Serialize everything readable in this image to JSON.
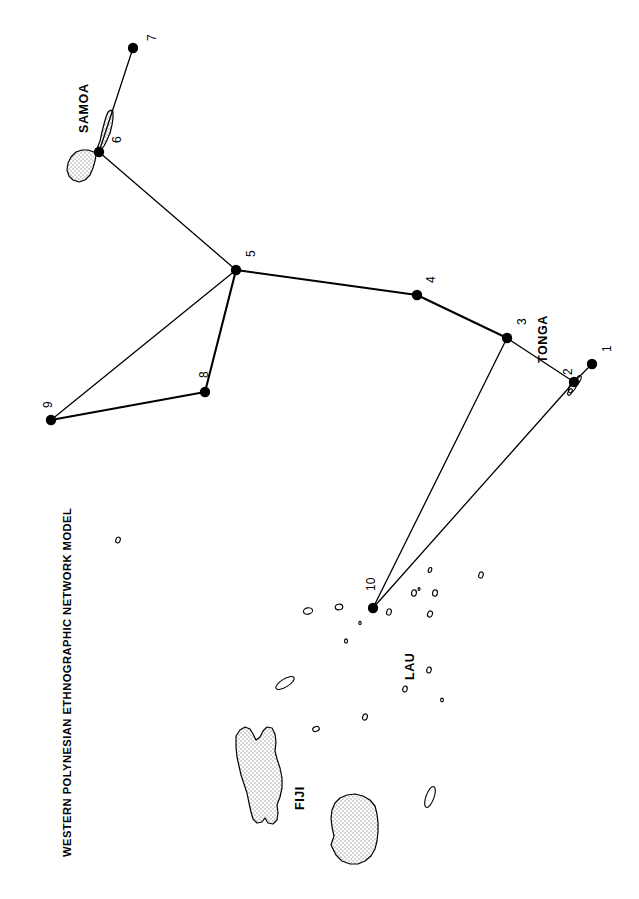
{
  "figure": {
    "title": "WESTERN POLYNESIAN ETHNOGRAPHIC NETWORK MODEL",
    "title_orientation": "rotated-90-ccw",
    "background_color": "#ffffff",
    "ink_color": "#000000",
    "island_fill": "#e6e6e6",
    "width": 639,
    "height": 899
  },
  "region_labels": [
    {
      "name": "samoa-label",
      "text": "SAMOA",
      "x": 78,
      "y": 133,
      "rotate": -90
    },
    {
      "name": "tonga-label",
      "text": "TONGA",
      "x": 537,
      "y": 363,
      "rotate": -90
    },
    {
      "name": "lau-label",
      "text": "LAU",
      "x": 404,
      "y": 680,
      "rotate": -90
    },
    {
      "name": "fiji-label",
      "text": "FIJI",
      "x": 294,
      "y": 810,
      "rotate": -90
    }
  ],
  "network": {
    "node_count": 10,
    "edge_count": 10,
    "node_radius": 5.2,
    "nodes": [
      {
        "id": "1",
        "label": "1",
        "x": 592,
        "y": 364,
        "label_x": 601,
        "label_y": 352,
        "region": "Tonga"
      },
      {
        "id": "2",
        "label": "2",
        "x": 574,
        "y": 382,
        "label_x": 562,
        "label_y": 375,
        "region": "Tonga"
      },
      {
        "id": "3",
        "label": "3",
        "x": 507,
        "y": 338,
        "label_x": 516,
        "label_y": 325,
        "region": "Tonga"
      },
      {
        "id": "4",
        "label": "4",
        "x": 417,
        "y": 295,
        "label_x": 425,
        "label_y": 283,
        "region": "open-sea"
      },
      {
        "id": "5",
        "label": "5",
        "x": 236,
        "y": 270,
        "label_x": 245,
        "label_y": 257,
        "region": "open-sea"
      },
      {
        "id": "6",
        "label": "6",
        "x": 99,
        "y": 152,
        "label_x": 111,
        "label_y": 143,
        "region": "Samoa"
      },
      {
        "id": "7",
        "label": "7",
        "x": 133,
        "y": 48,
        "label_x": 146,
        "label_y": 41,
        "region": "Samoa"
      },
      {
        "id": "8",
        "label": "8",
        "x": 205,
        "y": 392,
        "label_x": 198,
        "label_y": 378,
        "region": "open-sea"
      },
      {
        "id": "9",
        "label": "9",
        "x": 51,
        "y": 420,
        "label_x": 42,
        "label_y": 408,
        "region": "open-sea"
      },
      {
        "id": "10",
        "label": "10",
        "x": 373,
        "y": 608,
        "label_x": 365,
        "label_y": 591,
        "region": "Lau"
      }
    ],
    "edges": [
      {
        "from": "7",
        "to": "6",
        "weight": "thin"
      },
      {
        "from": "6",
        "to": "5",
        "weight": "thin"
      },
      {
        "from": "5",
        "to": "4",
        "weight": "thick"
      },
      {
        "from": "4",
        "to": "3",
        "weight": "thick"
      },
      {
        "from": "3",
        "to": "2",
        "weight": "thin"
      },
      {
        "from": "2",
        "to": "1",
        "weight": "thin"
      },
      {
        "from": "5",
        "to": "8",
        "weight": "thick"
      },
      {
        "from": "5",
        "to": "9",
        "weight": "thin"
      },
      {
        "from": "8",
        "to": "9",
        "weight": "thick"
      },
      {
        "from": "3",
        "to": "10",
        "weight": "thin"
      },
      {
        "from": "2",
        "to": "10",
        "weight": "thin"
      }
    ]
  },
  "islands": {
    "large": [
      {
        "name": "savaii-island",
        "group": "Samoa",
        "path": "M 97,149 L 100,141 L 102,132 L 104,124 L 106,117 L 108,112 L 111,110 L 113,112 L 113,118 L 112,125 L 110,133 L 107,140 L 104,146 L 101,150 Z"
      },
      {
        "name": "upolu-island",
        "group": "Samoa",
        "path": "M 94,152 L 88,150 L 82,150 L 76,152 L 71,157 L 68,163 L 67,170 L 69,176 L 73,180 L 79,182 L 85,180 L 90,175 L 93,168 L 95,161 L 96,155 Z"
      },
      {
        "name": "vanua-levu-island",
        "group": "Fiji",
        "path": "M 236,736 L 240,730 L 245,727 L 250,729 L 253,734 L 256,740 L 260,737 L 263,731 L 267,727 L 272,728 L 275,734 L 276,742 L 275,751 L 277,759 L 280,768 L 282,778 L 282,788 L 280,797 L 277,805 L 278,813 L 277,820 L 273,824 L 268,823 L 265,818 L 262,822 L 257,823 L 253,819 L 251,812 L 249,803 L 247,793 L 244,784 L 241,775 L 239,766 L 237,757 L 236,747 Z"
      },
      {
        "name": "viti-levu-island",
        "group": "Fiji",
        "path": "M 331,845 L 334,836 L 332,827 L 331,818 L 332,810 L 335,803 L 340,798 L 347,795 L 355,794 L 363,796 L 370,800 L 375,806 L 377,814 L 378,823 L 378,832 L 377,841 L 375,849 L 371,856 L 365,861 L 358,864 L 350,864 L 342,861 L 336,855 Z"
      }
    ],
    "small": [
      {
        "name": "tonga-islet-a",
        "cx": 573,
        "cy": 386,
        "rx": 3.2,
        "ry": 7.5,
        "rot": 28
      },
      {
        "name": "tonga-islet-b",
        "cx": 578,
        "cy": 380,
        "rx": 2.2,
        "ry": 5.0,
        "rot": 30
      },
      {
        "name": "tonga-islet-c",
        "cx": 570,
        "cy": 392,
        "rx": 1.8,
        "ry": 3.6,
        "rot": 25
      },
      {
        "name": "lau-islet-01",
        "cx": 430,
        "cy": 570,
        "rx": 1.6,
        "ry": 2.6,
        "rot": 20
      },
      {
        "name": "lau-islet-02",
        "cx": 481,
        "cy": 575,
        "rx": 2.2,
        "ry": 3.2,
        "rot": 15
      },
      {
        "name": "lau-islet-03",
        "cx": 419,
        "cy": 589,
        "rx": 1.0,
        "ry": 1.4,
        "rot": 0
      },
      {
        "name": "lau-islet-04",
        "cx": 414,
        "cy": 593,
        "rx": 2.4,
        "ry": 3.2,
        "rot": 10
      },
      {
        "name": "lau-islet-05",
        "cx": 435,
        "cy": 593,
        "rx": 2.4,
        "ry": 3.2,
        "rot": 10
      },
      {
        "name": "lau-islet-06",
        "cx": 339,
        "cy": 607,
        "rx": 2.8,
        "ry": 3.8,
        "rot": 80
      },
      {
        "name": "lau-islet-07",
        "cx": 308,
        "cy": 611,
        "rx": 3.2,
        "ry": 4.6,
        "rot": 80
      },
      {
        "name": "lau-islet-08",
        "cx": 389,
        "cy": 612,
        "rx": 2.3,
        "ry": 3.2,
        "rot": 15
      },
      {
        "name": "lau-islet-09",
        "cx": 430,
        "cy": 614,
        "rx": 2.4,
        "ry": 3.2,
        "rot": 20
      },
      {
        "name": "lau-islet-10",
        "cx": 360,
        "cy": 623,
        "rx": 1.2,
        "ry": 1.6,
        "rot": 0
      },
      {
        "name": "lau-islet-11",
        "cx": 346,
        "cy": 641,
        "rx": 1.5,
        "ry": 2.1,
        "rot": 0
      },
      {
        "name": "lau-islet-12",
        "cx": 429,
        "cy": 670,
        "rx": 2.2,
        "ry": 3.0,
        "rot": 15
      },
      {
        "name": "lau-islet-13",
        "cx": 405,
        "cy": 689,
        "rx": 2.2,
        "ry": 3.0,
        "rot": 15
      },
      {
        "name": "lau-islet-14",
        "cx": 442,
        "cy": 700,
        "rx": 1.4,
        "ry": 1.9,
        "rot": 0
      },
      {
        "name": "lau-islet-15",
        "cx": 365,
        "cy": 717,
        "rx": 2.3,
        "ry": 3.2,
        "rot": 20
      },
      {
        "name": "lau-islet-16",
        "cx": 316,
        "cy": 729,
        "rx": 2.4,
        "ry": 3.4,
        "rot": 70
      },
      {
        "name": "lau-islet-17",
        "cx": 118,
        "cy": 540,
        "rx": 2.2,
        "ry": 3.0,
        "rot": 20
      },
      {
        "name": "fiji-islet-taveuni",
        "cx": 285,
        "cy": 683,
        "rx": 4.0,
        "ry": 10.5,
        "rot": 58
      },
      {
        "name": "fiji-islet-kadavu",
        "cx": 430,
        "cy": 797,
        "rx": 4.0,
        "ry": 11.0,
        "rot": 20
      }
    ]
  }
}
